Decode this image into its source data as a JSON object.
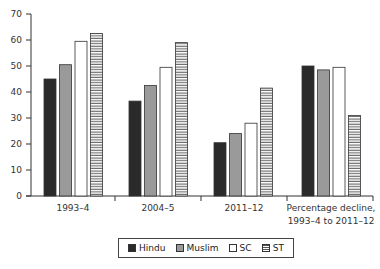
{
  "chart_data": {
    "type": "bar",
    "title": "",
    "xlabel": "",
    "ylabel": "",
    "ylim": [
      0,
      70
    ],
    "yticks": [
      0,
      10,
      20,
      30,
      40,
      50,
      60,
      70
    ],
    "grid": false,
    "legend_position": "bottom",
    "categories": [
      "1993–4",
      "2004–5",
      "2011–12",
      "Percentage decline,\n1993–4 to 2011–12"
    ],
    "series": [
      {
        "name": "Hindu",
        "values": [
          45,
          36.5,
          20.5,
          50
        ],
        "fill": "#2a2a2a"
      },
      {
        "name": "Muslim",
        "values": [
          50.5,
          42.5,
          24,
          48.5
        ],
        "fill": "#9a9a9a"
      },
      {
        "name": "SC",
        "values": [
          59.5,
          49.5,
          28,
          49.5
        ],
        "fill": "#ffffff"
      },
      {
        "name": "ST",
        "values": [
          62.5,
          59,
          41.5,
          31
        ],
        "fill": "hatch-horizontal"
      }
    ]
  },
  "category_labels": {
    "c0": "1993–4",
    "c1": "2004–5",
    "c2": "2011–12",
    "c3_line1": "Percentage decline,",
    "c3_line2": "1993–4 to 2011–12"
  },
  "legend": {
    "hindu": "Hindu",
    "muslim": "Muslim",
    "sc": "SC",
    "st": "ST"
  }
}
